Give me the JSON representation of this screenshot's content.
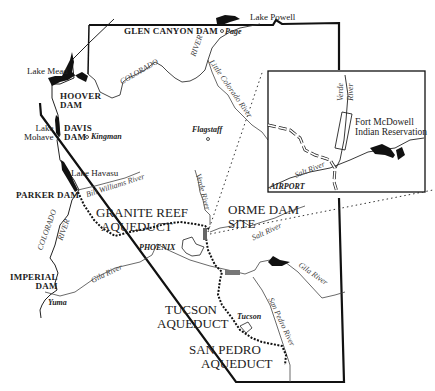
{
  "map": {
    "title": "Arizona water projects: dams, aqueducts and rivers",
    "dams": [
      {
        "id": "glen-canyon",
        "label": "GLEN CANYON DAM"
      },
      {
        "id": "hoover",
        "label_line1": "HOOVER",
        "label_line2": "DAM"
      },
      {
        "id": "davis",
        "label_line1": "DAVIS",
        "label_line2": "DAM"
      },
      {
        "id": "parker",
        "label": "PARKER DAM"
      },
      {
        "id": "imperial",
        "label_line1": "IMPERIAL",
        "label_line2": "DAM"
      },
      {
        "id": "orme",
        "label_line1": "ORME DAM",
        "label_line2": "SITE"
      }
    ],
    "lakes": [
      {
        "id": "powell",
        "label": "Lake Powell"
      },
      {
        "id": "mead",
        "label": "Lake Mead"
      },
      {
        "id": "mohave",
        "label_line1": "Lake",
        "label_line2": "Mohave"
      },
      {
        "id": "havasu",
        "label": "Lake Havasu"
      }
    ],
    "cities": [
      {
        "id": "page",
        "label": "Page"
      },
      {
        "id": "kingman",
        "label": "Kingman"
      },
      {
        "id": "flagstaff",
        "label": "Flagstaff"
      },
      {
        "id": "phoenix",
        "label": "PHOENIX"
      },
      {
        "id": "tucson",
        "label": "Tucson"
      },
      {
        "id": "yuma",
        "label": "Yuma"
      }
    ],
    "rivers": [
      {
        "id": "colorado-north",
        "label": "COLORADO"
      },
      {
        "id": "river-north",
        "label": "RIVER"
      },
      {
        "id": "little-colorado",
        "label": "Little Colorado River"
      },
      {
        "id": "bill-williams",
        "label": "Bill Williams River"
      },
      {
        "id": "verde",
        "label": "Verde River"
      },
      {
        "id": "colorado-south",
        "label": "COLORADO"
      },
      {
        "id": "river-south",
        "label": "RIVER"
      },
      {
        "id": "gila-west",
        "label": "Gila River"
      },
      {
        "id": "salt",
        "label": "Salt River"
      },
      {
        "id": "gila-east",
        "label": "Gila River"
      },
      {
        "id": "san-pedro",
        "label": "San Pedro River"
      }
    ],
    "aqueducts": [
      {
        "id": "granite-reef",
        "label_line1": "GRANITE REEF",
        "label_line2": "AQUEDUCT"
      },
      {
        "id": "tucson",
        "label_line1": "TUCSON",
        "label_line2": "AQUEDUCT"
      },
      {
        "id": "san-pedro",
        "label_line1": "SAN PEDRO",
        "label_line2": "AQUEDUCT"
      }
    ],
    "inset": {
      "reservation_line1": "Fort McDowell",
      "reservation_line2": "Indian Reservation",
      "verde_line1": "Verde",
      "verde_line2": "River",
      "salt": "Salt River",
      "airport": "AIRPORT"
    }
  }
}
